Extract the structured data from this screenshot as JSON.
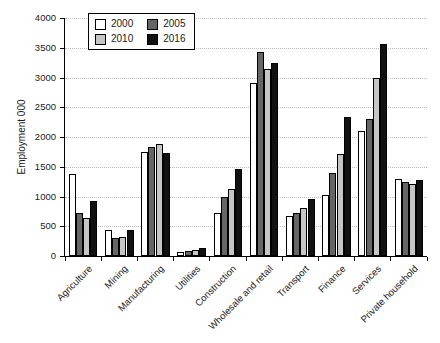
{
  "chart_data": {
    "type": "bar",
    "title": "",
    "xlabel": "",
    "ylabel": "Employment 000",
    "categories": [
      "Agriculture",
      "Mining",
      "Manufacturing",
      "Utilities",
      "Construction",
      "Wholesale and retail",
      "Transport",
      "Finance",
      "Services",
      "Private household"
    ],
    "series": [
      {
        "name": "2000",
        "color": "#ffffff",
        "values": [
          1380,
          440,
          1750,
          70,
          720,
          2900,
          670,
          1030,
          2100,
          1290
        ]
      },
      {
        "name": "2005",
        "color": "#666666",
        "values": [
          720,
          310,
          1830,
          80,
          1000,
          3430,
          720,
          1390,
          2310,
          1250
        ]
      },
      {
        "name": "2010",
        "color": "#c6c6c6",
        "values": [
          640,
          320,
          1880,
          100,
          1120,
          3150,
          800,
          1710,
          3000,
          1210
        ]
      },
      {
        "name": "2016",
        "color": "#111111",
        "values": [
          930,
          430,
          1730,
          140,
          1470,
          3240,
          960,
          2330,
          3570,
          1270
        ]
      }
    ],
    "ylim": [
      0,
      4000
    ],
    "yticks": [
      0,
      500,
      1000,
      1500,
      2000,
      2500,
      3000,
      3500,
      4000
    ],
    "grid": "horizontal-dotted",
    "gridline_color": "#bdbdbd",
    "legend_position": "top-left",
    "legend_order": [
      "2000",
      "2005",
      "2010",
      "2016"
    ]
  }
}
